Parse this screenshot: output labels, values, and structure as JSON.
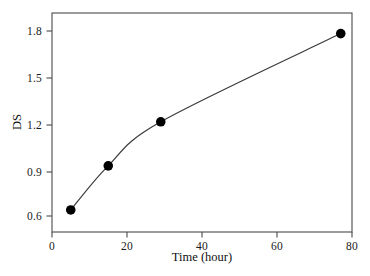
{
  "chart_data": {
    "type": "line",
    "title": "",
    "subtitle": "",
    "xlabel": "Time (hour)",
    "ylabel": "DS",
    "xlim": [
      0,
      80
    ],
    "ylim": [
      0.45,
      1.94
    ],
    "xticks": [
      "0",
      "20",
      "40",
      "60",
      "80"
    ],
    "xtick_values": [
      0,
      20,
      40,
      60,
      80
    ],
    "yticks": [
      "0.6",
      "0.9",
      "1.2",
      "1.5",
      "1.8"
    ],
    "ytick_values": [
      0.6,
      0.9,
      1.2,
      1.5,
      1.8
    ],
    "grid": false,
    "legend": null,
    "series": [
      {
        "name": "DS",
        "marker": "filled-circle",
        "marker_color": "#000000",
        "line_color": "#3a3a3a",
        "x": [
          5,
          15,
          29,
          77
        ],
        "y": [
          0.6,
          0.9,
          1.2,
          1.8
        ],
        "points": [
          {
            "x": 5,
            "y": 0.6
          },
          {
            "x": 15,
            "y": 0.9
          },
          {
            "x": 29,
            "y": 1.2
          },
          {
            "x": 77,
            "y": 1.8
          }
        ]
      }
    ],
    "annotations": []
  },
  "figure": {
    "background_color": "#ffffff",
    "frame_color": "#4a4a4a",
    "axis_text_color": "#111111"
  }
}
